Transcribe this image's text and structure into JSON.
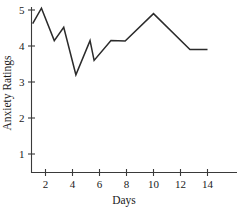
{
  "chart_data": {
    "type": "line",
    "title": "",
    "xlabel": "Days",
    "ylabel": "Anxiety Ratings",
    "xlim": [
      0.8,
      14.3
    ],
    "ylim": [
      0,
      5.35
    ],
    "grid": false,
    "legend": null,
    "xticks": [
      2,
      4,
      6,
      8,
      10,
      12,
      14
    ],
    "xtick_labels": [
      "2",
      "4",
      "6",
      "8",
      "10",
      "12",
      "14"
    ],
    "yticks": [
      1,
      2,
      3,
      4,
      5
    ],
    "ytick_labels": [
      "1",
      "2",
      "3",
      "4",
      "5"
    ],
    "series": [
      {
        "name": "Anxiety Ratings",
        "color": "#2b2b2b",
        "x": [
          1.05,
          1.7,
          2.65,
          3.35,
          4.25,
          5.3,
          5.6,
          6.85,
          7.9,
          10.0,
          12.7,
          14.0
        ],
        "y": [
          4.62,
          5.05,
          4.15,
          4.52,
          3.2,
          4.15,
          3.6,
          4.15,
          4.14,
          4.9,
          3.9,
          3.9
        ]
      }
    ]
  },
  "axes": {
    "x_axis_name": "days-axis",
    "y_axis_name": "anxiety-ratings-axis"
  }
}
